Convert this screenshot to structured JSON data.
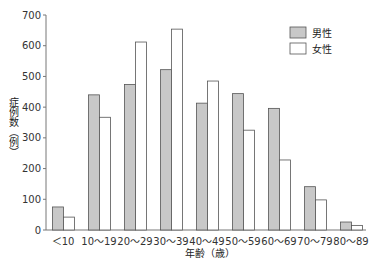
{
  "chart_data": {
    "type": "bar",
    "title": "",
    "xlabel": "年齢（歳）",
    "ylabel": "症例数（例）",
    "ylim": [
      0,
      700
    ],
    "yticks": [
      0,
      100,
      200,
      300,
      400,
      500,
      600,
      700
    ],
    "grid": false,
    "legend_position": "upper right",
    "categories": [
      "＜10",
      "10～19",
      "20～29",
      "30～39",
      "40～49",
      "50～59",
      "60～69",
      "70～79",
      "80～89"
    ],
    "series": [
      {
        "name": "男性",
        "color": "#c8c8c8",
        "values": [
          75,
          440,
          474,
          522,
          413,
          444,
          396,
          141,
          26
        ]
      },
      {
        "name": "女性",
        "color": "#ffffff",
        "values": [
          42,
          367,
          612,
          654,
          485,
          325,
          228,
          98,
          15
        ]
      }
    ]
  },
  "colors": {
    "axis": "#777777",
    "bar_stroke": "#555555"
  }
}
